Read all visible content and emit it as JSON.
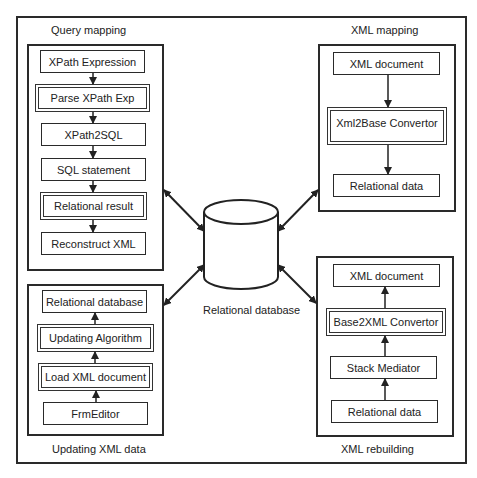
{
  "diagram": {
    "groups": [
      {
        "id": "query-mapping",
        "title": "Query mapping",
        "nodes": [
          {
            "label": "XPath Expression",
            "emphasis": false
          },
          {
            "label": "Parse XPath Exp",
            "emphasis": true
          },
          {
            "label": "XPath2SQL",
            "emphasis": false
          },
          {
            "label": "SQL statement",
            "emphasis": false
          },
          {
            "label": "Relational result",
            "emphasis": true
          },
          {
            "label": "Reconstruct XML",
            "emphasis": false
          }
        ],
        "flow": "top-to-bottom"
      },
      {
        "id": "xml-mapping",
        "title": "XML mapping",
        "nodes": [
          {
            "label": "XML document",
            "emphasis": false
          },
          {
            "label": "Xml2Base Convertor",
            "emphasis": true
          },
          {
            "label": "Relational data",
            "emphasis": false
          }
        ],
        "flow": "top-to-bottom"
      },
      {
        "id": "updating-xml-data",
        "title": "Updating XML data",
        "nodes": [
          {
            "label": "Relational database",
            "emphasis": false
          },
          {
            "label": "Updating Algorithm",
            "emphasis": true
          },
          {
            "label": "Load XML document",
            "emphasis": true
          },
          {
            "label": "FrmEditor",
            "emphasis": false
          }
        ],
        "flow": "bottom-to-top"
      },
      {
        "id": "xml-rebuilding",
        "title": "XML rebuilding",
        "nodes": [
          {
            "label": "XML document",
            "emphasis": false
          },
          {
            "label": "Base2XML Convertor",
            "emphasis": true
          },
          {
            "label": "Stack Mediator",
            "emphasis": false
          },
          {
            "label": "Relational data",
            "emphasis": false
          }
        ],
        "flow": "bottom-to-top"
      }
    ],
    "center": {
      "shape": "database-cylinder",
      "label": "Relational database"
    },
    "connections": [
      {
        "from": "query-mapping",
        "to": "center",
        "type": "bidirectional"
      },
      {
        "from": "xml-mapping",
        "to": "center",
        "type": "bidirectional"
      },
      {
        "from": "updating-xml-data",
        "to": "center",
        "type": "bidirectional"
      },
      {
        "from": "xml-rebuilding",
        "to": "center",
        "type": "bidirectional"
      }
    ]
  }
}
